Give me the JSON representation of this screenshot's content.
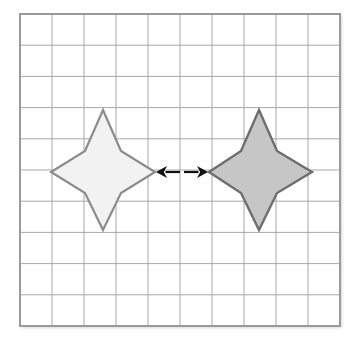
{
  "figure": {
    "background_color": "#ffffff",
    "canvas": {
      "width": 358,
      "height": 348
    }
  },
  "grid": {
    "name": "square-grid",
    "x": 20,
    "y": 14,
    "width": 320,
    "height": 312,
    "columns": 10,
    "rows": 10,
    "cell_width": 32,
    "cell_height": 31.2,
    "line_color": "#a8a8a8",
    "line_width": 1,
    "border_color": "#9a9a9a",
    "border_width": 2,
    "fill_color": "#ffffff",
    "show_grid": true
  },
  "shapes": [
    {
      "name": "star-left",
      "label": "preimage",
      "type": "four-pointed-star",
      "center_x": 103,
      "center_y": 172,
      "tip_left_x": 51,
      "tip_right_x": 155,
      "tip_top_y": 110,
      "tip_bottom_y": 230,
      "inner_radius_x": 18,
      "inner_radius_y": 21,
      "fill_color": "#f2f2f2",
      "stroke_color": "#8c8c8c",
      "stroke_width": 2.2
    },
    {
      "name": "star-right",
      "label": "image",
      "type": "four-pointed-star",
      "center_x": 259,
      "center_y": 172,
      "tip_left_x": 209,
      "tip_right_x": 312,
      "tip_top_y": 110,
      "tip_bottom_y": 230,
      "inner_radius_x": 18,
      "inner_radius_y": 21,
      "fill_color": "#c6c6c6",
      "stroke_color": "#6e6e6e",
      "stroke_width": 2.4
    }
  ],
  "arrows": {
    "name": "double-headed-arrow",
    "color": "#111111",
    "y": 172,
    "left_arrow": {
      "name": "arrow-left",
      "tail_x": 180,
      "head_x": 156,
      "direction": "left"
    },
    "right_arrow": {
      "name": "arrow-right",
      "tail_x": 184,
      "head_x": 208,
      "direction": "right"
    },
    "shaft_width": 2.2,
    "head_length": 11,
    "head_half_width": 6
  }
}
